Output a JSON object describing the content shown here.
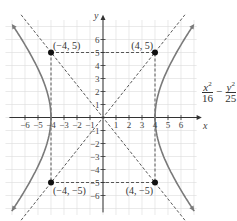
{
  "figure": {
    "axis_labels": {
      "x": "x",
      "y": "y"
    },
    "x_ticks": [
      "−6",
      "−5",
      "−4",
      "−3",
      "−2",
      "−1",
      "1",
      "2",
      "3",
      "4",
      "5",
      "6"
    ],
    "y_ticks": [
      "6",
      "5",
      "4",
      "3",
      "2",
      "1",
      "−1",
      "−2",
      "−3",
      "−4",
      "−5",
      "−6"
    ],
    "points": [
      {
        "label": "(−4, 5)",
        "x": -4,
        "y": 5
      },
      {
        "label": "(4, 5)",
        "x": 4,
        "y": 5
      },
      {
        "label": "(−4, −5)",
        "x": -4,
        "y": -5
      },
      {
        "label": "(4, −5)",
        "x": 4,
        "y": -5
      }
    ],
    "equation": {
      "term1_num": "x",
      "term1_exp": "2",
      "term1_den": "16",
      "minus": "−",
      "term2_num": "y",
      "term2_exp": "2",
      "term2_den": "25",
      "rhs": "= 1"
    },
    "colors": {
      "curve": "#7a7a7a",
      "grid": "#dcdcdc",
      "axis": "#333333",
      "dashed": "#444444",
      "point": "#111111"
    }
  },
  "chart_data": {
    "type": "line",
    "title": "",
    "xlabel": "x",
    "ylabel": "y",
    "xlim": [
      -7,
      7
    ],
    "ylim": [
      -7,
      7
    ],
    "grid": true,
    "series": [
      {
        "name": "hyperbola right branch",
        "equation": "x = 4*sqrt(1 + y^2/25), x>0"
      },
      {
        "name": "hyperbola left branch",
        "equation": "x = -4*sqrt(1 + y^2/25), x<0"
      },
      {
        "name": "asymptote 1",
        "equation": "y = 1.25x",
        "style": "dashed"
      },
      {
        "name": "asymptote 2",
        "equation": "y = -1.25x",
        "style": "dashed"
      },
      {
        "name": "rectangle",
        "points": [
          [
            -4,
            5
          ],
          [
            4,
            5
          ],
          [
            4,
            -5
          ],
          [
            -4,
            -5
          ]
        ],
        "style": "dashed"
      }
    ],
    "annotations": [
      "(−4, 5)",
      "(4, 5)",
      "(−4, −5)",
      "(4, −5)",
      "x²/16 − y²/25 = 1"
    ]
  }
}
